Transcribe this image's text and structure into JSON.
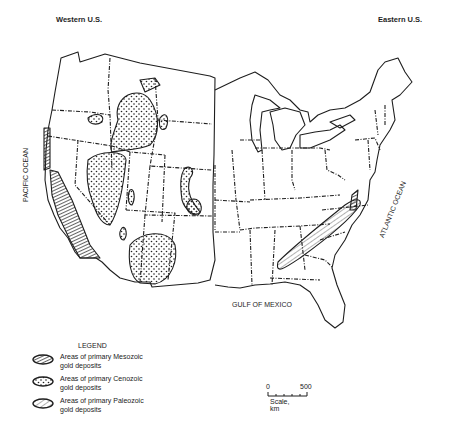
{
  "header": {
    "left_title": "Western U.S.",
    "right_title": "Eastern U.S."
  },
  "map_labels": {
    "pacific": "PACIFIC OCEAN",
    "atlantic": "ATLANTIC OCEAN",
    "gulf": "GULF OF MEXICO"
  },
  "legend": {
    "title": "LEGEND",
    "items": [
      {
        "icon": "mesozoic-pattern-icon",
        "line1": "Areas of primary Mesozoic",
        "line2": "gold deposits",
        "pattern": "dense-hatch"
      },
      {
        "icon": "cenozoic-pattern-icon",
        "line1": "Areas of primary Cenozoic",
        "line2": "gold deposits",
        "pattern": "stipple"
      },
      {
        "icon": "paleozoic-pattern-icon",
        "line1": "Areas of primary Paleozoic",
        "line2": "gold deposits",
        "pattern": "diagonal-lines"
      }
    ]
  },
  "scale": {
    "start": "0",
    "end": "500",
    "label": "Scale, km"
  },
  "colors": {
    "ink": "#1e1e1e",
    "background": "#ffffff"
  }
}
